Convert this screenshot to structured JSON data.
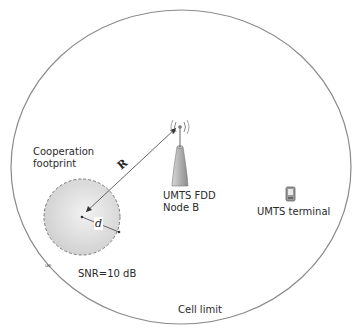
{
  "diagram": {
    "labels": {
      "cooperation_footprint_line1": "Cooperation",
      "cooperation_footprint_line2": "footprint",
      "node_b_line1": "UMTS FDD",
      "node_b_line2": "Node B",
      "terminal": "UMTS terminal",
      "snr": "SNR=10 dB",
      "cell_limit": "Cell limit",
      "radius_R": "R",
      "radius_d": "d",
      "edge_tag": "ue"
    },
    "icons": [
      "antenna-tower-icon",
      "mobile-terminal-icon"
    ],
    "colors": {
      "cell_outline": "#8a8a8a",
      "footprint_fill": "#d9d9d9",
      "footprint_outline": "#777777",
      "arrow": "#555555"
    }
  }
}
